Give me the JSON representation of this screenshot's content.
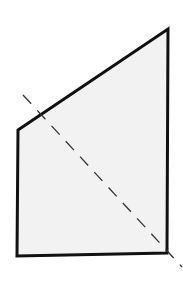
{
  "diagram": {
    "type": "geometric-figure",
    "shape": {
      "name": "quadrilateral",
      "points": "18,130 168,29 167,253 17,256",
      "fill": "#f2f2f2",
      "stroke": "#111111",
      "stroke_width": 3
    },
    "dashed_line": {
      "name": "diagonal-symmetry-line",
      "x1": 23,
      "y1": 95,
      "x2": 182,
      "y2": 267,
      "stroke": "#333333",
      "stroke_width": 1.3,
      "dash": "12,9"
    }
  }
}
